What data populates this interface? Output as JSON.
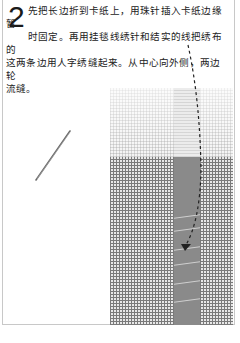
{
  "step": {
    "number": "2",
    "text_line1": "先把长边折到卡纸上，用珠针插入卡纸边缘暂",
    "text_line2": "时固定。再用挂毯线绣针和结实的线把绣布的",
    "text_line3": "这两条边用人字绣缝起来。从中心向外侧，两边轮",
    "text_line4": "流缝。"
  },
  "illustration": {
    "needle_icon": "embroidery-needle",
    "arrow_icon": "dashed-arrow-down",
    "fabric": "canvas-with-folded-edges",
    "colors": {
      "canvas_light": "#f4f4f4",
      "canvas_grid": "#7a7a7a",
      "seam_strip": "#8a8a8a",
      "stitch": "#cfcfcf",
      "frame_border": "#c8c8c8"
    }
  }
}
